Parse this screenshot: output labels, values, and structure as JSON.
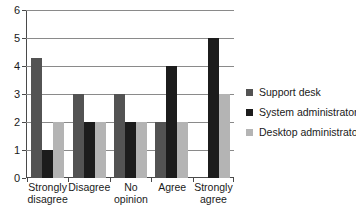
{
  "chart_data": {
    "type": "bar",
    "title": "",
    "subtitle": "",
    "xlabel": "",
    "ylabel": "",
    "ylim": [
      0,
      6
    ],
    "yticks": [
      0,
      1,
      2,
      3,
      4,
      5,
      6
    ],
    "ytick_labels": [
      "0",
      "1",
      "2",
      "3",
      "4",
      "5",
      "6"
    ],
    "grid": true,
    "grid_axis": "y",
    "legend_position": "right",
    "categories": [
      "Strongly disagree",
      "Disagree",
      "No opinion",
      "Agree",
      "Strongly agree"
    ],
    "category_lines": [
      [
        "Strongly",
        "disagree"
      ],
      [
        "Disagree"
      ],
      [
        "No opinion"
      ],
      [
        "Agree"
      ],
      [
        "Strongly",
        "agree"
      ]
    ],
    "series": [
      {
        "name": "Support desk",
        "color": "#535353",
        "values": [
          4.3,
          3,
          3,
          2,
          0
        ]
      },
      {
        "name": "System administrators",
        "color": "#1c1c1c",
        "values": [
          1,
          2,
          2,
          4,
          5
        ]
      },
      {
        "name": "Desktop administrators",
        "color": "#b4b4b4",
        "values": [
          2,
          2,
          2,
          2,
          3
        ]
      }
    ]
  },
  "axis": {
    "y": {
      "tick_0": "0",
      "tick_1": "1",
      "tick_2": "2",
      "tick_3": "3",
      "tick_4": "4",
      "tick_5": "5",
      "tick_6": "6"
    }
  },
  "legend": {
    "items": [
      {
        "label": "Support desk",
        "color": "#535353"
      },
      {
        "label": "System administrators",
        "color": "#1c1c1c"
      },
      {
        "label": "Desktop administrators",
        "color": "#b4b4b4"
      }
    ]
  },
  "colors": {
    "series_support_desk": "#535353",
    "series_system_administrators": "#1c1c1c",
    "series_desktop_administrators": "#b4b4b4",
    "axis": "#4a4a4a",
    "gridline": "#8a8a8a",
    "text": "#1a1a1a",
    "background": "#ffffff"
  }
}
